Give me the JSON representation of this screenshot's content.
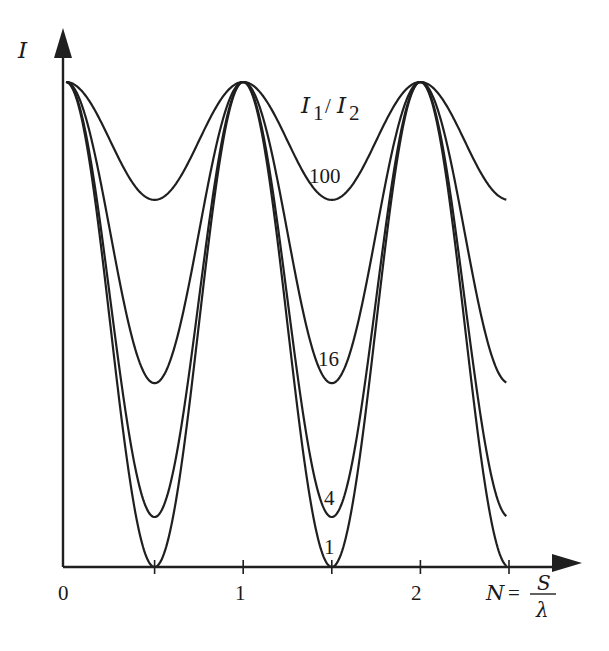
{
  "chart_data": {
    "type": "line",
    "title": "",
    "xlabel": "N = S/λ",
    "ylabel": "I",
    "legend_title": "I1/I2",
    "x_ticks": [
      "0",
      "1",
      "2"
    ],
    "x_minor_ticks": [
      0.5,
      1.5,
      2.5
    ],
    "xlim": [
      0,
      2.5
    ],
    "ylim": [
      0,
      1
    ],
    "grid": false,
    "formula": "I ∝ 1 - m·(1 - cos(2πN))/2, maxima at integer N, minima at half-integer N",
    "series": [
      {
        "name": "100",
        "ratio": 100,
        "max": 1.0,
        "min": 0.757,
        "label_at": {
          "x": 1.5,
          "y": 0.8
        }
      },
      {
        "name": "16",
        "ratio": 16,
        "max": 1.0,
        "min": 0.379,
        "label_at": {
          "x": 1.5,
          "y": 0.42
        }
      },
      {
        "name": "4",
        "ratio": 4,
        "max": 1.0,
        "min": 0.103,
        "label_at": {
          "x": 1.5,
          "y": 0.14
        }
      },
      {
        "name": "1",
        "ratio": 1,
        "max": 1.0,
        "min": 0.0,
        "label_at": {
          "x": 1.5,
          "y": 0.04
        }
      }
    ]
  },
  "labels": {
    "y_axis": "I",
    "x_axis_lhs": "N",
    "x_axis_eq": "=",
    "x_axis_num": "S",
    "x_axis_den": "λ",
    "legend_I": "I",
    "legend_sub1": "1",
    "legend_slash": "/",
    "legend_sub2": "2",
    "tick_0": "0",
    "tick_1": "1",
    "tick_2": "2",
    "curve_100": "100",
    "curve_16": "16",
    "curve_4": "4",
    "curve_1": "1"
  }
}
